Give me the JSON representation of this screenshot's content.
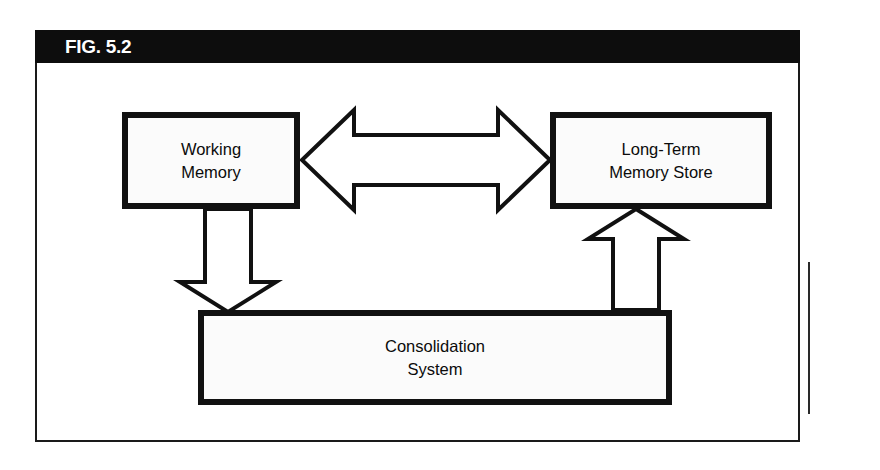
{
  "figure": {
    "label": "FIG. 5.2",
    "frame_color": "#1a1a1a",
    "header_background": "#0d0d0d",
    "header_text_color": "#ffffff",
    "background": "#ffffff"
  },
  "diagram": {
    "type": "block-diagram",
    "nodes": [
      {
        "id": "working-memory",
        "label": "Working\nMemory",
        "border_color": "#111111",
        "fill_color": "#fbfbfb"
      },
      {
        "id": "long-term-memory-store",
        "label": "Long-Term\nMemory Store",
        "border_color": "#111111",
        "fill_color": "#fbfbfb"
      },
      {
        "id": "consolidation-system",
        "label": "Consolidation\nSystem",
        "border_color": "#111111",
        "fill_color": "#fbfbfb"
      }
    ],
    "connectors": [
      {
        "id": "wm-ltm-bidirectional",
        "from": "working-memory",
        "to": "long-term-memory-store",
        "style": "hollow-block-arrow",
        "direction": "bidirectional",
        "orientation": "horizontal"
      },
      {
        "id": "wm-to-consolidation",
        "from": "working-memory",
        "to": "consolidation-system",
        "style": "hollow-block-arrow",
        "direction": "down",
        "orientation": "vertical"
      },
      {
        "id": "consolidation-to-ltm",
        "from": "consolidation-system",
        "to": "long-term-memory-store",
        "style": "hollow-block-arrow",
        "direction": "up",
        "orientation": "vertical"
      }
    ]
  },
  "side_caption": {
    "lines": [
      "",
      "",
      "",
      "",
      ""
    ]
  }
}
